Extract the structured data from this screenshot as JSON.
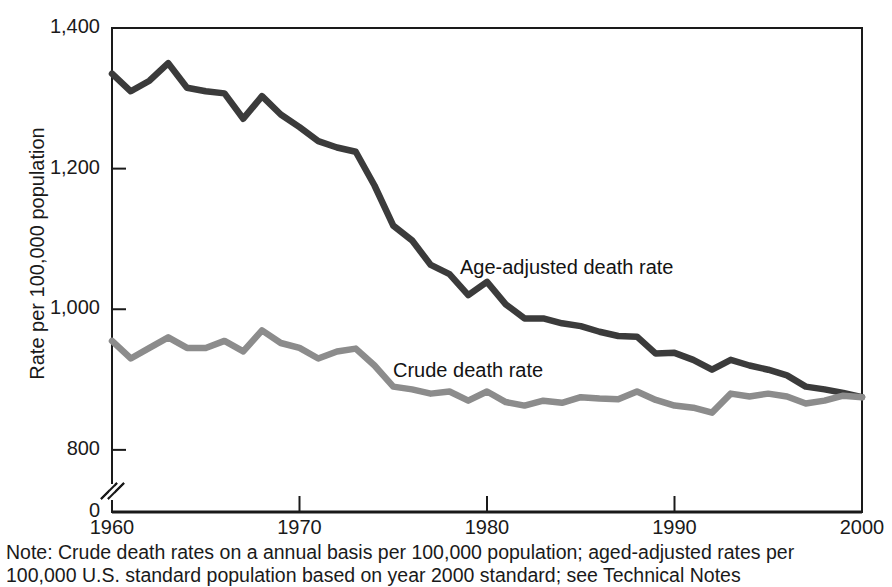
{
  "figure": {
    "y_axis_title": "Rate per 100,000 population",
    "y_ticks": [
      {
        "label": "1,400",
        "value": 1400
      },
      {
        "label": "1,200",
        "value": 1200
      },
      {
        "label": "1,000",
        "value": 1000
      },
      {
        "label": "800",
        "value": 800
      },
      {
        "label": "0",
        "value": 0
      }
    ],
    "x_ticks": [
      {
        "label": "1960",
        "value": 1960
      },
      {
        "label": "1970",
        "value": 1970
      },
      {
        "label": "1980",
        "value": 1980
      },
      {
        "label": "1990",
        "value": 1990
      },
      {
        "label": "2000",
        "value": 2000
      }
    ],
    "annotations": {
      "age_adjusted": "Age-adjusted death rate",
      "crude": "Crude death rate"
    },
    "note_line_1": "Note: Crude death rates on a annual basis per 100,000 population; aged-adjusted rates per",
    "note_line_2": "100,000 U.S. standard population based on year 2000 standard; see Technical Notes",
    "colors": {
      "age_adjusted_line": "#3b3b3b",
      "crude_line": "#8c8c8c",
      "axis": "#1a1a1a",
      "background": "#ffffff"
    }
  },
  "chart_data": {
    "type": "line",
    "title": "",
    "xlabel": "",
    "ylabel": "Rate per 100,000 population",
    "xlim": [
      1960,
      2000
    ],
    "ylim": [
      760,
      1400
    ],
    "y_axis_broken": true,
    "y_break_between": [
      0,
      760
    ],
    "grid": false,
    "legend": "inline-annotations",
    "x": [
      1960,
      1961,
      1962,
      1963,
      1964,
      1965,
      1966,
      1967,
      1968,
      1969,
      1970,
      1971,
      1972,
      1973,
      1974,
      1975,
      1976,
      1977,
      1978,
      1979,
      1980,
      1981,
      1982,
      1983,
      1984,
      1985,
      1986,
      1987,
      1988,
      1989,
      1990,
      1991,
      1992,
      1993,
      1994,
      1995,
      1996,
      1997,
      1998,
      1999,
      2000
    ],
    "series": [
      {
        "name": "Age-adjusted death rate",
        "color": "#3b3b3b",
        "values": [
          1335,
          1310,
          1325,
          1350,
          1315,
          1310,
          1307,
          1271,
          1303,
          1277,
          1259,
          1239,
          1230,
          1224,
          1176,
          1119,
          1098,
          1063,
          1050,
          1020,
          1039,
          1007,
          987,
          987,
          980,
          976,
          968,
          962,
          961,
          937,
          938,
          928,
          914,
          928,
          920,
          914,
          906,
          890,
          886,
          881,
          875
        ]
      },
      {
        "name": "Crude death rate",
        "color": "#8c8c8c",
        "values": [
          955,
          930,
          945,
          960,
          945,
          945,
          955,
          940,
          970,
          952,
          945,
          930,
          940,
          944,
          920,
          890,
          886,
          880,
          883,
          870,
          883,
          868,
          863,
          870,
          867,
          875,
          873,
          872,
          883,
          871,
          863,
          860,
          853,
          880,
          876,
          880,
          876,
          866,
          870,
          877,
          875
        ]
      }
    ]
  }
}
